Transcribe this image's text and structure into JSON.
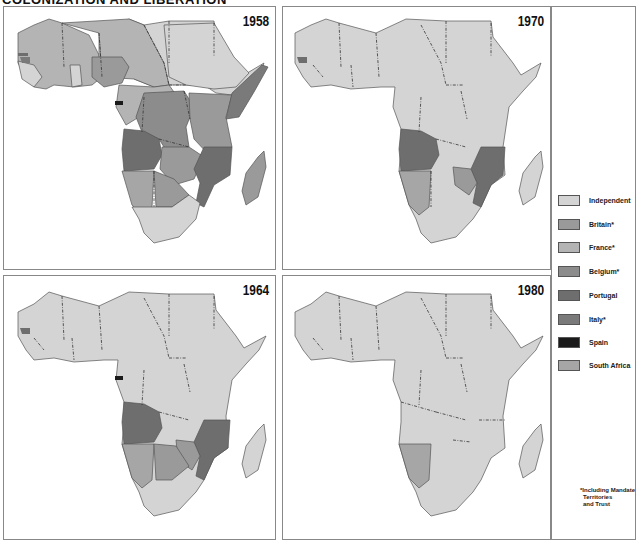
{
  "title": "COLONIZATION AND LIBERATION",
  "colors": {
    "independent": "#d4d4d4",
    "britain": "#9a9a9a",
    "france": "#b4b4b4",
    "belgium": "#8c8c8c",
    "portugal": "#6e6e6e",
    "italy": "#7a7a7a",
    "spain": "#1a1a1a",
    "south_africa": "#a6a6a6"
  },
  "panels": [
    {
      "year": "1958"
    },
    {
      "year": "1970"
    },
    {
      "year": "1964"
    },
    {
      "year": "1980"
    }
  ],
  "legend": {
    "items": [
      {
        "label": "Independent",
        "color": "#d4d4d4"
      },
      {
        "label": "Britain*",
        "color": "#9a9a9a"
      },
      {
        "label": "France*",
        "color": "#b4b4b4"
      },
      {
        "label": "Belgium*",
        "color": "#8c8c8c"
      },
      {
        "label": "Portugal",
        "color": "#6e6e6e"
      },
      {
        "label": "Italy*",
        "color": "#7a7a7a"
      },
      {
        "label": "Spain",
        "color": "#1a1a1a"
      },
      {
        "label": "South Africa",
        "color": "#a6a6a6"
      }
    ],
    "footnote_line1": "*Including Mandate",
    "footnote_line2": "Territories",
    "footnote_line3": "and Trust"
  }
}
